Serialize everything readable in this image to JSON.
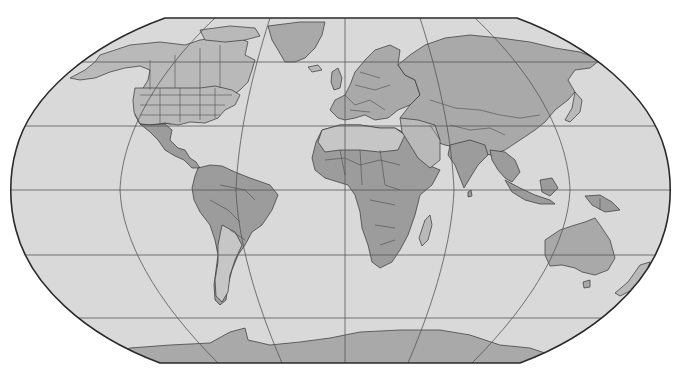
{
  "map": {
    "title": "",
    "projection": "Robinson",
    "style": "grayscale political world map",
    "colors": {
      "background": "#ffffff",
      "ocean": "#d9d9d9",
      "land_dark": "#9c9c9c",
      "land_mid": "#a9a9a9",
      "land_light": "#b9b9b9",
      "land_pale": "#c6c6c6",
      "graticule": "#555555",
      "frame": "#2a2a2a"
    },
    "graticule": {
      "parallels_y": [
        62,
        126,
        190,
        255,
        318
      ],
      "central_meridian_x": 345
    },
    "regions": [
      {
        "id": "north-america",
        "name": "North America"
      },
      {
        "id": "greenland",
        "name": "Greenland"
      },
      {
        "id": "south-america",
        "name": "South America"
      },
      {
        "id": "europe",
        "name": "Europe"
      },
      {
        "id": "africa",
        "name": "Africa"
      },
      {
        "id": "madagascar",
        "name": "Madagascar"
      },
      {
        "id": "asia",
        "name": "Asia"
      },
      {
        "id": "india",
        "name": "India"
      },
      {
        "id": "southeast-asia",
        "name": "Southeast Asia"
      },
      {
        "id": "japan",
        "name": "Japan"
      },
      {
        "id": "australia",
        "name": "Australia"
      },
      {
        "id": "new-zealand",
        "name": "New Zealand"
      },
      {
        "id": "antarctica",
        "name": "Antarctica"
      }
    ]
  }
}
